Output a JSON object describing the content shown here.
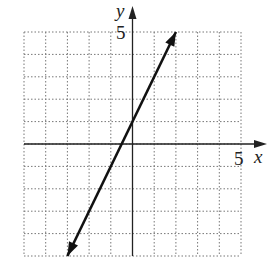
{
  "chart_data": {
    "type": "line",
    "title": "",
    "xlabel": "x",
    "ylabel": "y",
    "xlim": [
      -5,
      5
    ],
    "ylim": [
      -5,
      5
    ],
    "grid": true,
    "tick_labels": {
      "x": [
        "5"
      ],
      "y": [
        "5"
      ]
    },
    "series": [
      {
        "name": "line",
        "equation": "y = 2x + 1",
        "x": [
          -3,
          -0.5,
          0,
          2
        ],
        "y": [
          -5,
          0,
          1,
          5
        ],
        "arrows": "both"
      }
    ]
  },
  "labels": {
    "x_axis": "x",
    "y_axis": "y",
    "x_tick": "5",
    "y_tick": "5"
  },
  "colors": {
    "axis": "#222222",
    "grid": "#777777",
    "line": "#111111"
  }
}
